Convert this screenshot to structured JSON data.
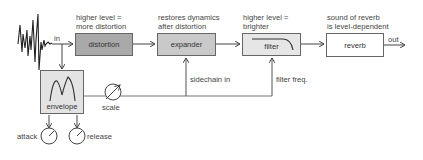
{
  "diagram": {
    "input_label": "in",
    "output_label": "out",
    "blocks": [
      {
        "id": "distortion",
        "label": "distortion",
        "note_line1": "higher level =",
        "note_line2": "more distortion",
        "fill": "#a9a9a9"
      },
      {
        "id": "expander",
        "label": "expander",
        "note_line1": "restores dynamics",
        "note_line2": "after distortion",
        "fill": "#c9c9c9"
      },
      {
        "id": "filter",
        "label": "filter",
        "note_line1": "higher level =",
        "note_line2": "brighter",
        "fill": "#e6e6e6"
      },
      {
        "id": "reverb",
        "label": "reverb",
        "note_line1": "sound of reverb",
        "note_line2": "is level-dependent",
        "fill": "#ffffff"
      }
    ],
    "envelope": {
      "label": "envelope",
      "fill": "#e3e3e3"
    },
    "scale_label": "scale",
    "sidechain_label": "sidechain in",
    "filter_freq_label": "filter freq.",
    "knobs": [
      {
        "id": "attack",
        "label": "attack"
      },
      {
        "id": "release",
        "label": "release"
      }
    ]
  }
}
